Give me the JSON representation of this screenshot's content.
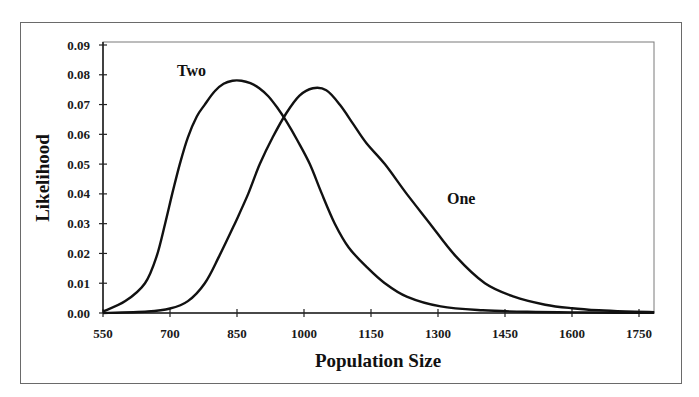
{
  "chart_data": {
    "type": "line",
    "title": "",
    "xlabel": "Population Size",
    "ylabel": "Likelihood",
    "xlim": [
      550,
      1784
    ],
    "ylim": [
      0,
      0.09
    ],
    "grid": false,
    "legend": "inline labels",
    "x_ticks": [
      550,
      700,
      850,
      1000,
      1150,
      1300,
      1450,
      1600,
      1750
    ],
    "x_tick_labels": [
      "550",
      "700",
      "850",
      "1000",
      "1150",
      "1300",
      "1450",
      "1600",
      "1750"
    ],
    "y_ticks": [
      0,
      0.01,
      0.02,
      0.03,
      0.04,
      0.05,
      0.06,
      0.07,
      0.08,
      0.09
    ],
    "y_tick_labels": [
      "0.00",
      "0.01",
      "0.02",
      "0.03",
      "0.04",
      "0.05",
      "0.06",
      "0.07",
      "0.08",
      "0.09"
    ],
    "series": [
      {
        "name": "Two",
        "label_position": {
          "x": 748,
          "y": 0.0795
        },
        "x": [
          550,
          600,
          644,
          670,
          689,
          705,
          722,
          740,
          760,
          778,
          800,
          820,
          840,
          860,
          880,
          900,
          920,
          940,
          960,
          985,
          1013,
          1040,
          1069,
          1100,
          1140,
          1181,
          1230,
          1306,
          1400,
          1500,
          1600,
          1700,
          1784
        ],
        "values": [
          0.0005,
          0.004,
          0.01,
          0.019,
          0.03,
          0.04,
          0.05,
          0.059,
          0.066,
          0.07,
          0.0745,
          0.077,
          0.078,
          0.078,
          0.0772,
          0.0755,
          0.0728,
          0.069,
          0.0645,
          0.058,
          0.05,
          0.04,
          0.03,
          0.022,
          0.0155,
          0.01,
          0.0055,
          0.0022,
          0.0009,
          0.0004,
          0.0002,
          0.0001,
          0.0001
        ]
      },
      {
        "name": "One",
        "label_position": {
          "x": 1352,
          "y": 0.0365
        },
        "x": [
          550,
          650,
          700,
          740,
          778,
          810,
          845,
          875,
          901,
          930,
          960,
          990,
          1020,
          1050,
          1080,
          1110,
          1140,
          1181,
          1230,
          1282,
          1340,
          1405,
          1470,
          1540,
          1600,
          1660,
          1720,
          1784
        ],
        "values": [
          0.0,
          0.0005,
          0.0015,
          0.004,
          0.01,
          0.019,
          0.03,
          0.04,
          0.05,
          0.059,
          0.067,
          0.073,
          0.0755,
          0.0748,
          0.07,
          0.0635,
          0.057,
          0.05,
          0.04,
          0.03,
          0.019,
          0.01,
          0.0055,
          0.0028,
          0.0016,
          0.0009,
          0.0005,
          0.0003
        ]
      }
    ]
  }
}
